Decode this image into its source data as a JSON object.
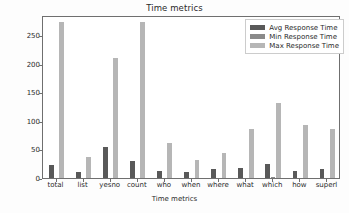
{
  "chart_data": {
    "type": "bar",
    "title": "Time metrics",
    "xlabel": "Time metrics",
    "ylabel": "Number of seconds",
    "categories": [
      "total",
      "list",
      "yesno",
      "count",
      "who",
      "when",
      "where",
      "what",
      "which",
      "how",
      "superl"
    ],
    "series": [
      {
        "name": "Avg Response Time",
        "color": "#595959",
        "values": [
          22,
          11,
          54,
          30,
          13,
          10,
          15,
          18,
          25,
          12,
          16
        ]
      },
      {
        "name": "Min Response Time",
        "color": "#8a8a8a",
        "values": [
          0,
          0,
          0,
          0,
          0,
          0,
          0,
          0,
          1,
          0,
          0
        ]
      },
      {
        "name": "Max Response Time",
        "color": "#b6b6b6",
        "values": [
          272,
          37,
          209,
          272,
          61,
          32,
          44,
          86,
          132,
          93,
          86
        ]
      }
    ],
    "yticks": [
      0,
      50,
      100,
      150,
      200,
      250
    ],
    "ylim": [
      0,
      285
    ],
    "grid": false,
    "legend_position": "upper right"
  },
  "legend": {
    "items": [
      {
        "label": "Avg Response Time"
      },
      {
        "label": "Min Response Time"
      },
      {
        "label": "Max Response Time"
      }
    ]
  }
}
